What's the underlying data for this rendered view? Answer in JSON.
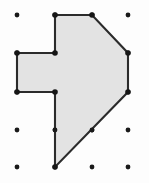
{
  "figure": {
    "title": "Geoboard polygon on dot grid",
    "width": 149,
    "height": 183,
    "background_color": "#fdfdfd"
  },
  "grid": {
    "label": "dot-grid",
    "columns": 4,
    "rows": 5,
    "x_positions": [
      17,
      55,
      92,
      128
    ],
    "y_positions": [
      15,
      53,
      92,
      130,
      167
    ],
    "spacing_x": 37,
    "spacing_y": 38,
    "dot_radius": 2.4,
    "dot_color": "#1a1a1a",
    "dots": [
      {
        "x": 17,
        "y": 15
      },
      {
        "x": 55,
        "y": 15
      },
      {
        "x": 92,
        "y": 15
      },
      {
        "x": 128,
        "y": 15
      },
      {
        "x": 17,
        "y": 53
      },
      {
        "x": 55,
        "y": 53
      },
      {
        "x": 92,
        "y": 53
      },
      {
        "x": 128,
        "y": 53
      },
      {
        "x": 17,
        "y": 92
      },
      {
        "x": 55,
        "y": 92
      },
      {
        "x": 92,
        "y": 92
      },
      {
        "x": 128,
        "y": 92
      },
      {
        "x": 17,
        "y": 130
      },
      {
        "x": 55,
        "y": 130
      },
      {
        "x": 92,
        "y": 130
      },
      {
        "x": 128,
        "y": 130
      },
      {
        "x": 17,
        "y": 167
      },
      {
        "x": 55,
        "y": 167
      },
      {
        "x": 92,
        "y": 167
      },
      {
        "x": 128,
        "y": 167
      }
    ]
  },
  "polygon": {
    "label": "arrow-polygon",
    "fill_color": "#e3e3e3",
    "stroke_color": "#2b2b2b",
    "stroke_width": 2.1,
    "sides": 9,
    "points_attr": "55,15 92,15 128,53 128,92 55,167 55,92 17,92 17,53 55,53",
    "vertices": [
      {
        "name": "top-left",
        "x": 55,
        "y": 15
      },
      {
        "name": "top-right",
        "x": 92,
        "y": 15
      },
      {
        "name": "upper-right",
        "x": 128,
        "y": 53
      },
      {
        "name": "lower-right",
        "x": 128,
        "y": 92
      },
      {
        "name": "bottom-point",
        "x": 55,
        "y": 167
      },
      {
        "name": "inner-left-lower",
        "x": 55,
        "y": 92
      },
      {
        "name": "notch-bottom-left",
        "x": 17,
        "y": 92
      },
      {
        "name": "notch-top-left",
        "x": 17,
        "y": 53
      },
      {
        "name": "inner-left-upper",
        "x": 55,
        "y": 53
      }
    ]
  },
  "vertex_markers": {
    "label": "vertex-markers",
    "radius": 2.8,
    "color": "#161616",
    "points": [
      {
        "x": 55,
        "y": 15
      },
      {
        "x": 92,
        "y": 15
      },
      {
        "x": 128,
        "y": 53
      },
      {
        "x": 128,
        "y": 92
      },
      {
        "x": 55,
        "y": 167
      },
      {
        "x": 55,
        "y": 92
      },
      {
        "x": 17,
        "y": 92
      },
      {
        "x": 17,
        "y": 53
      },
      {
        "x": 55,
        "y": 53
      }
    ]
  },
  "on_edge_dots": {
    "label": "dots-on-polygon-edges",
    "points": [
      {
        "x": 55,
        "y": 130,
        "edge": "left-vertical"
      },
      {
        "x": 92,
        "y": 130,
        "edge": "lower-diagonal"
      }
    ]
  }
}
